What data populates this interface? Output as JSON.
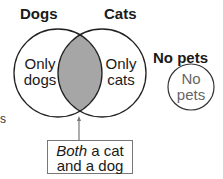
{
  "diagram": {
    "type": "venn",
    "sets": [
      {
        "label": "Dogs",
        "region_label_line1": "Only",
        "region_label_line2": "dogs"
      },
      {
        "label": "Cats",
        "region_label_line1": "Only",
        "region_label_line2": "cats"
      }
    ],
    "intersection": {
      "fill": "#a6a6a6",
      "callout_emphasis": "Both",
      "callout_rest_line1": " a cat",
      "callout_line2": "and a dog"
    },
    "separate_set": {
      "label": "No pets",
      "region_label_line1": "No",
      "region_label_line2": "pets"
    },
    "edge_fragment": "s"
  }
}
